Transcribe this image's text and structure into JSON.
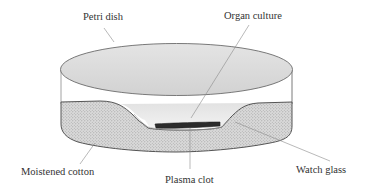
{
  "diagram": {
    "labels": {
      "petri_dish": "Petri dish",
      "organ_culture": "Organ culture",
      "moistened_cotton": "Moistened cotton",
      "plasma_clot": "Plasma clot",
      "watch_glass": "Watch glass"
    },
    "colors": {
      "lid_fill": "#dedede",
      "lid_stroke": "#6b6b6b",
      "cotton_fill": "#d4d4d4",
      "cotton_stroke": "#555555",
      "watch_glass_fill": "#ededed",
      "plasma_clot": "#2b2b2b",
      "leader_line": "#8a8a8a",
      "text": "#333333"
    }
  }
}
